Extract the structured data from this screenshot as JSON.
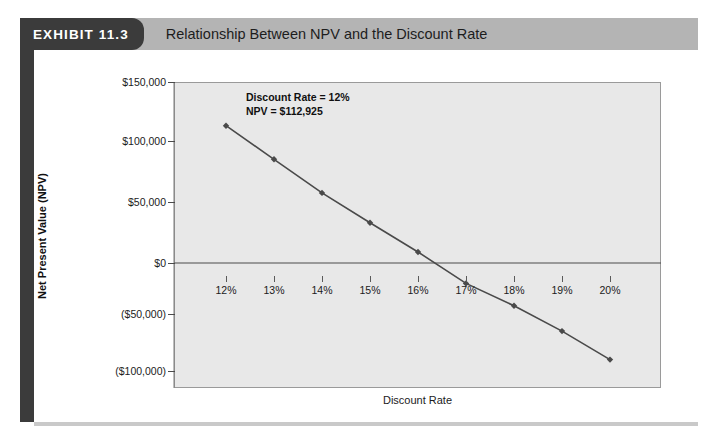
{
  "header": {
    "exhibit_tag": "EXHIBIT 11.3",
    "title": "Relationship Between NPV and the Discount Rate"
  },
  "chart_data": {
    "type": "line",
    "title": "Relationship Between NPV and the Discount Rate",
    "xlabel": "Discount Rate",
    "ylabel": "Net Present Value (NPV)",
    "categories": [
      "12%",
      "13%",
      "14%",
      "15%",
      "16%",
      "17%",
      "18%",
      "19%",
      "20%"
    ],
    "x": [
      12,
      13,
      14,
      15,
      16,
      17,
      18,
      19,
      20
    ],
    "values": [
      112925,
      85000,
      57470,
      33000,
      9000,
      -20000,
      -42000,
      -65000,
      -90000
    ],
    "ytick_labels": [
      "$150,000",
      "$100,000",
      "$50,000",
      "$0",
      "($50,000)",
      "($100,000)"
    ],
    "ytick_values": [
      150000,
      100000,
      50000,
      0,
      -50000,
      -100000
    ],
    "ylim": [
      -100000,
      150000
    ],
    "xlim": [
      11.4,
      20.4
    ],
    "grid": false,
    "legend": "none",
    "series_color": "#4a4a4a",
    "plot_background": "#e8e8e8",
    "zero_line": 0,
    "annotations": [
      {
        "id": "ann-12",
        "lines": [
          "Discount Rate = 12%",
          "NPV = $112,925"
        ],
        "points_to": "12% data point"
      },
      {
        "id": "ann-14",
        "lines": [
          "Discount Rate = 14%",
          "NPV = $57,470"
        ],
        "points_to": "14% data point"
      },
      {
        "id": "ann-irr",
        "lines": [
          "Internal Rate of Return",
          "(IRR) is the discount",
          "rate that would yield an",
          "NPV of O."
        ],
        "points_to": "zero crossing between 16% and 17%"
      }
    ]
  }
}
